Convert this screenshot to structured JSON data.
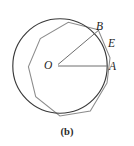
{
  "figure": {
    "caption": "(b)",
    "labels": {
      "center": "O",
      "point_b": "B",
      "point_e": "E",
      "point_a": "A"
    },
    "colors": {
      "circle_stroke": "#3a3a3a",
      "polygon_stroke": "#8c8c8c",
      "radius_stroke": "#6e6e6e",
      "text": "#1d1d1d",
      "background": "#ffffff"
    },
    "geometry": {
      "description": "Circle with circumscribed regular nonagon, two radii OA and OB drawn from center O",
      "center": {
        "x": 60,
        "y": 66
      },
      "circle_radius": 47,
      "polygon_sides": 9,
      "polygon_circumradius": 50,
      "polygon_rotation_deg": 20,
      "radius_OA": {
        "angle_deg": 0,
        "end_x": 107,
        "end_y": 66
      },
      "radius_OB": {
        "angle_deg": 43,
        "end_x": 94,
        "end_y": 34
      },
      "point_E": {
        "x": 107,
        "y": 48,
        "note": "point on polygon edge between B and A"
      }
    }
  }
}
